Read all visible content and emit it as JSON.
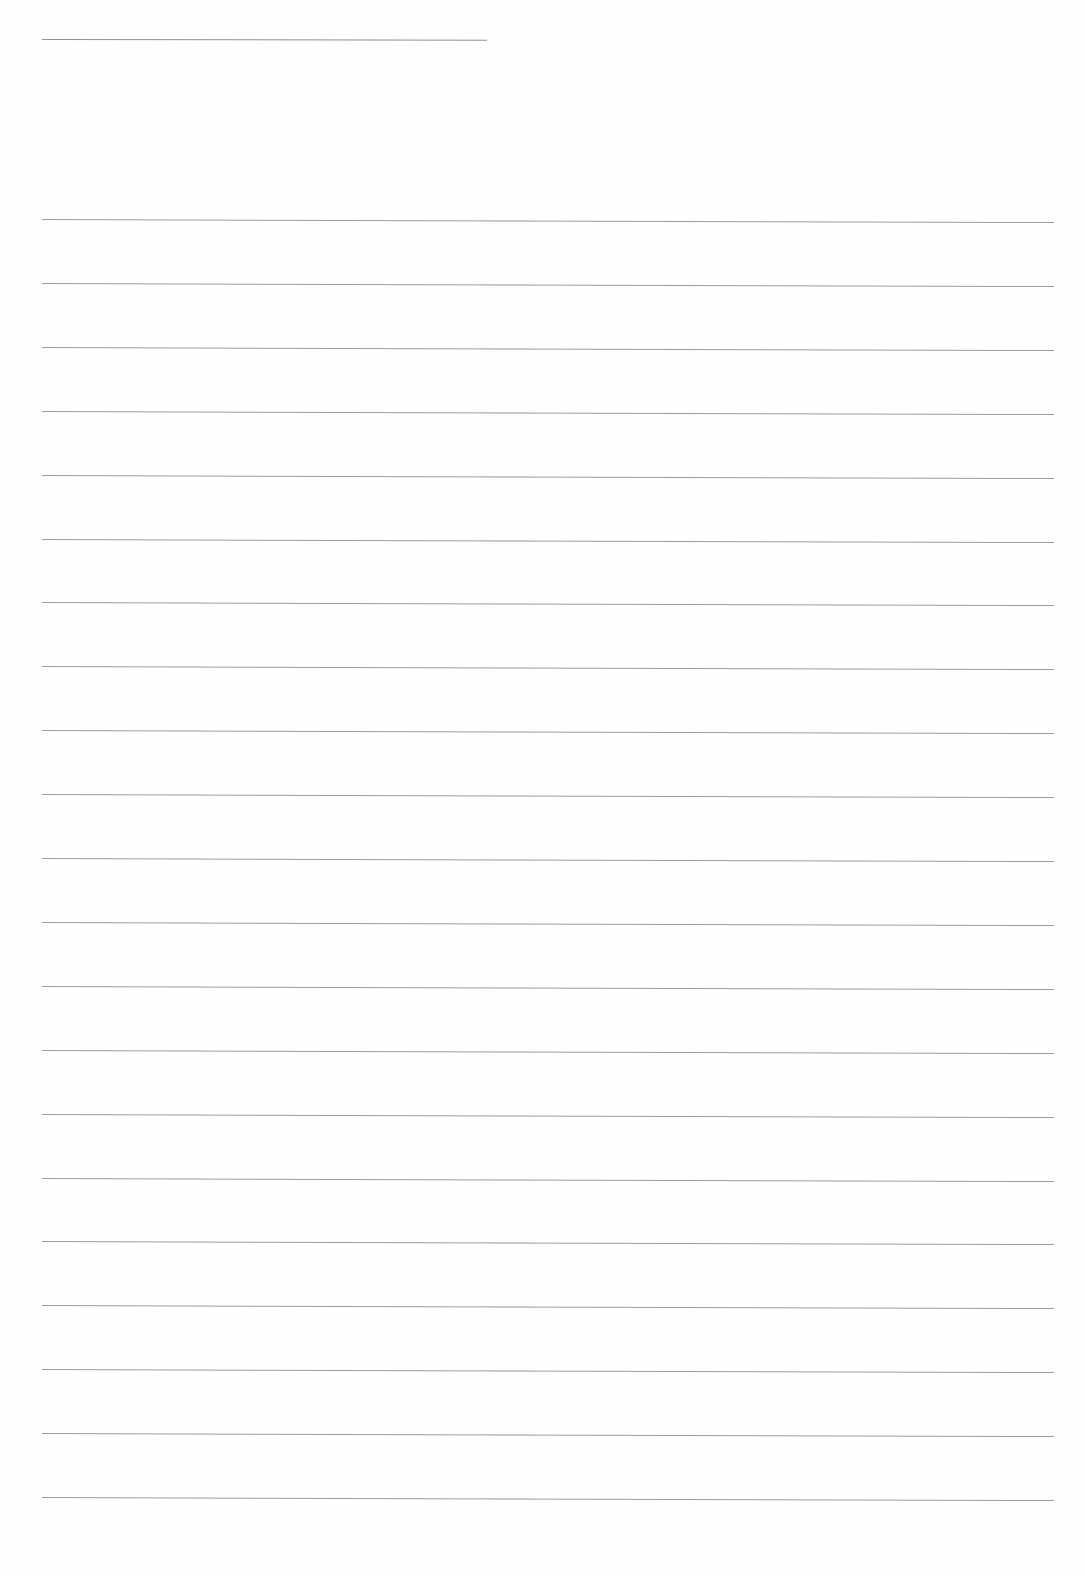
{
  "page": {
    "type": "blank-lined-paper",
    "background": "#fefefe",
    "line_color": "#8a8a8a"
  },
  "header_line": {
    "x1": 42,
    "x2": 487,
    "y": 39
  },
  "ruled_lines": {
    "count": 21,
    "x1": 42,
    "x2": 1054,
    "y_start": 219,
    "spacing": 63.9,
    "tilt_px": 3
  }
}
